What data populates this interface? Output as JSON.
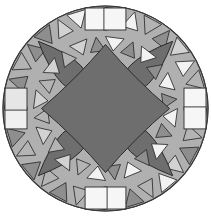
{
  "figure": {
    "width": 211,
    "height": 217,
    "background_color": "#ffffff"
  },
  "geometry": {
    "center_x": 105.5,
    "center_y": 108.5,
    "outer_radius": 103,
    "inner_ring_radius": 84,
    "petal_ring_radius": 72,
    "star_radius": 52,
    "symmetry_order": 4,
    "ring_segments": 32
  },
  "palette": {
    "dark_gray": "#6e6e6e",
    "mid_gray": "#8e8e8e",
    "light_gray": "#b4b4b4",
    "pale_gray": "#d2d2d2",
    "near_white": "#f2f2f2",
    "white": "#fbfbfb",
    "outline": "#2b2b2b",
    "background": "#ffffff"
  },
  "chart_data": {
    "type": "pie",
    "xlabel": "",
    "ylabel": "",
    "categories": [
      "dark-star-center",
      "dark-lens-petals",
      "triangle-ring",
      "square-tiles",
      "outer-rim"
    ],
    "values": [
      22,
      24,
      30,
      16,
      8
    ],
    "legend_position": "none",
    "grid": false
  },
  "elements": {
    "outer_disc": {
      "name": "outer-disc",
      "fill": "#b4b4b4"
    },
    "center_star": {
      "name": "center-astroid-star",
      "fill": "#6e6e6e"
    },
    "petals": [
      {
        "name": "petal-top-left",
        "fill": "#6e6e6e",
        "angle": 135
      },
      {
        "name": "petal-top-right",
        "fill": "#6e6e6e",
        "angle": 45
      },
      {
        "name": "petal-bottom-right",
        "fill": "#6e6e6e",
        "angle": 315
      },
      {
        "name": "petal-bottom-left",
        "fill": "#6e6e6e",
        "angle": 225
      }
    ],
    "cardinal_squares": [
      {
        "name": "square-top-a",
        "fill": "#f6f6f6"
      },
      {
        "name": "square-top-b",
        "fill": "#f6f6f6"
      },
      {
        "name": "square-right-a",
        "fill": "#f6f6f6"
      },
      {
        "name": "square-right-b",
        "fill": "#f6f6f6"
      },
      {
        "name": "square-bottom-a",
        "fill": "#f6f6f6"
      },
      {
        "name": "square-bottom-b",
        "fill": "#f6f6f6"
      },
      {
        "name": "square-left-a",
        "fill": "#f0f0f0"
      },
      {
        "name": "square-left-b",
        "fill": "#e6e6e6"
      }
    ]
  }
}
